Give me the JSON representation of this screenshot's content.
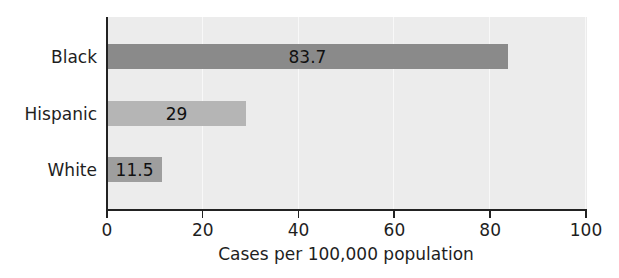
{
  "chart_data": {
    "type": "bar",
    "orientation": "horizontal",
    "title": "",
    "categories": [
      "Black",
      "Hispanic",
      "White"
    ],
    "values": [
      83.7,
      29,
      11.5
    ],
    "value_labels": [
      "83.7",
      "29",
      "11.5"
    ],
    "bar_colors": [
      "#8a8a8a",
      "#b5b5b5",
      "#9e9e9e"
    ],
    "xlabel": "Cases per 100,000 population",
    "ylabel": "",
    "xlim": [
      0,
      100
    ],
    "xticks": [
      0,
      20,
      40,
      60,
      80,
      100
    ],
    "xtick_labels": [
      "0",
      "20",
      "40",
      "60",
      "80",
      "100"
    ],
    "grid": true,
    "legend": null
  },
  "colors": {
    "plot_background": "#ececec",
    "gridline": "#f8f8f8",
    "axis": "#222222"
  }
}
